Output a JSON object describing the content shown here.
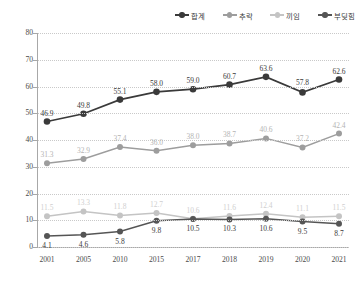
{
  "legend": {
    "items": [
      {
        "label": "합계",
        "color": "#3a3a3a",
        "icon": "line-marker-icon"
      },
      {
        "label": "추락",
        "color": "#9d9d9d",
        "icon": "line-marker-icon"
      },
      {
        "label": "끼임",
        "color": "#c4c4c4",
        "icon": "line-marker-icon"
      },
      {
        "label": "부딪힘",
        "color": "#555555",
        "icon": "line-marker-icon"
      }
    ]
  },
  "axes": {
    "y_ticks": [
      "80",
      "70",
      "60",
      "50",
      "40",
      "30",
      "20",
      "10",
      "0"
    ],
    "x_ticks": [
      "2001",
      "2005",
      "2010",
      "2015",
      "2017",
      "2018",
      "2019",
      "2020",
      "2021"
    ]
  },
  "chart_data": {
    "type": "line",
    "title": "",
    "xlabel": "",
    "ylabel": "",
    "ylim": [
      0,
      80
    ],
    "ytick_step": 10,
    "grid": true,
    "legend_position": "top-right",
    "categories": [
      "2001",
      "2005",
      "2010",
      "2015",
      "2017",
      "2018",
      "2019",
      "2020",
      "2021"
    ],
    "series": [
      {
        "name": "합계",
        "color": "#3a3a3a",
        "label_color": "#3a3a3a",
        "values": [
          46.9,
          49.8,
          55.1,
          58.0,
          59.0,
          60.7,
          63.6,
          57.8,
          62.6
        ],
        "labels": [
          "46.9",
          "49.8",
          "55.1",
          "58.0",
          "59.0",
          "60.7",
          "63.6",
          "57.8",
          "62.6"
        ]
      },
      {
        "name": "추락",
        "color": "#9d9d9d",
        "label_color": "#b4b4b4",
        "values": [
          31.3,
          32.9,
          37.4,
          36.0,
          38.0,
          38.7,
          40.6,
          37.2,
          42.4
        ],
        "labels": [
          "31.3",
          "32.9",
          "37.4",
          "36.0",
          "38.0",
          "38.7",
          "40.6",
          "37.2",
          "42.4"
        ]
      },
      {
        "name": "끼임",
        "color": "#c4c4c4",
        "label_color": "#cfcfcf",
        "values": [
          11.5,
          13.3,
          11.8,
          12.7,
          10.6,
          11.6,
          12.4,
          11.1,
          11.5
        ],
        "labels": [
          "11.5",
          "13.3",
          "11.8",
          "12.7",
          "10.6",
          "11.6",
          "12.4",
          "11.1",
          "11.5"
        ]
      },
      {
        "name": "부딪힘",
        "color": "#555555",
        "label_color": "#3a3a3a",
        "values": [
          4.1,
          4.6,
          5.8,
          9.8,
          10.5,
          10.3,
          10.6,
          9.5,
          8.7
        ],
        "labels": [
          "4.1",
          "4.6",
          "5.8",
          "9.8",
          "10.5",
          "10.3",
          "10.6",
          "9.5",
          "8.7"
        ]
      }
    ]
  }
}
